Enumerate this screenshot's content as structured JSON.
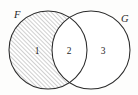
{
  "figure": {
    "kind": "venn-diagram",
    "background_color": "#fdfdfc",
    "outline_color": "#2b2b2b",
    "hatch_color": "#8d8d8d",
    "label_color": "#262626"
  },
  "sets": [
    {
      "id": "F",
      "label": "F",
      "label_x": 14,
      "label_y": 18,
      "circle": {
        "cx": 48,
        "cy": 50,
        "r": 39
      }
    },
    {
      "id": "G",
      "label": "G",
      "label_x": 121,
      "label_y": 22,
      "circle": {
        "cx": 91,
        "cy": 50,
        "r": 39
      }
    }
  ],
  "regions": [
    {
      "id": "region-1",
      "label": "1",
      "meaning": "F only",
      "shaded": "hatched",
      "label_x": 37,
      "label_y": 54
    },
    {
      "id": "region-2",
      "label": "2",
      "meaning": "F and G",
      "shaded": "none",
      "label_x": 69,
      "label_y": 54
    },
    {
      "id": "region-3",
      "label": "3",
      "meaning": "G only",
      "shaded": "none",
      "label_x": 103,
      "label_y": 54
    }
  ],
  "hatching": {
    "angle_degrees": 45,
    "spacing_px": 3,
    "direction": "lower-left to upper-right"
  }
}
